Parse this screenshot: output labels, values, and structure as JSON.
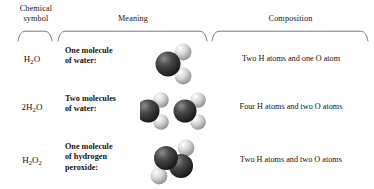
{
  "headers": {
    "chemical_symbol": "Chemical\nsymbol",
    "chemical_symbol_line1": "Chemical",
    "chemical_symbol_line2": "symbol",
    "meaning": "Meaning",
    "composition": "Composition"
  },
  "rows": [
    {
      "formula_html": "H<sub>2</sub>O",
      "formula_text": "H2O",
      "meaning_line1": "One molecule",
      "meaning_line2": "of water:",
      "meaning_line3": "",
      "model": "water-molecule-single",
      "model_count": 1,
      "composition": "Two H atoms and one O atom"
    },
    {
      "formula_html": "2H<sub>2</sub>O",
      "formula_text": "2H2O",
      "meaning_line1": "Two molecules",
      "meaning_line2": "of water:",
      "meaning_line3": "",
      "model": "water-molecule-double",
      "model_count": 2,
      "composition": "Four H atoms and two O atoms"
    },
    {
      "formula_html": "H<sub>2</sub>O<sub>2</sub>",
      "formula_text": "H2O2",
      "meaning_line1": "One molecule",
      "meaning_line2": "of hydrogen",
      "meaning_line3": "peroxide:",
      "model": "hydrogen-peroxide-molecule",
      "model_count": 1,
      "composition": "Two H atoms and two O atoms"
    }
  ],
  "colors": {
    "text": "#15120f",
    "rule": "#6e6e6e",
    "oxygen_dark": "#2b2b2b",
    "oxygen_light": "#9a9a9a",
    "hydrogen_dark": "#8f8f8f",
    "hydrogen_light": "#f2f2f2",
    "background": "#ffffff"
  }
}
